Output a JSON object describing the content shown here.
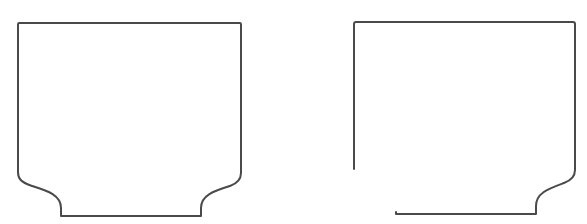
{
  "diagram": {
    "background": "#ffffff",
    "stroke_color": "#4a4a4a",
    "stroke_width": 2,
    "shapes": [
      {
        "id": "left-profile",
        "description": "Closed profile: rectangle with symmetric concave fillets at both bottom corners",
        "path": "M 19 23 L 240 23 Q 241 23 241 25 L 241 173 Q 241 182 230 186 C 214 191 201 195 201 208 L 201 216 L 61 216 L 61 208 C 61 195 48 191 32 186 C 20 182 18 178 18 172 L 18 25 Q 18 23 19 23 Z"
      },
      {
        "id": "right-profile",
        "description": "Open profile: rectangle with concave fillet at bottom-right corner only, open gap at bottom-left",
        "path": "M 354 169 L 354 24 Q 354 22 356 22 L 573 22 Q 575 22 575 24 L 575 170 Q 575 179 564 183 C 548 189 536 193 536 206 L 536 214 L 396 214 L 396 212"
      }
    ]
  }
}
